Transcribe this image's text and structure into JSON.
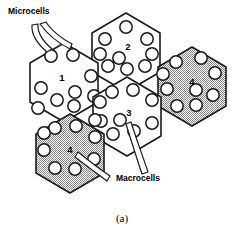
{
  "figure": {
    "caption": "(a)",
    "labels": {
      "microcells": "Microcells",
      "macrocells": "Macrocells"
    },
    "colors": {
      "outline": "#1a1a1a",
      "cell_fill_white": "#ffffff",
      "cell_fill_shaded": "#b8b8b8",
      "text": "#000000"
    },
    "cells": [
      {
        "id": "cell-1",
        "number": "1",
        "type": "microcell-cluster",
        "shaded": false,
        "center_x": 64,
        "center_y": 78,
        "label_x": 62,
        "label_y": 78,
        "microcell_count": 9
      },
      {
        "id": "cell-2",
        "number": "2",
        "type": "microcell-cluster",
        "shaded": false,
        "center_x": 126,
        "center_y": 48,
        "label_x": 128,
        "label_y": 47,
        "microcell_count": 9
      },
      {
        "id": "cell-3",
        "number": "3",
        "type": "microcell-cluster",
        "shaded": false,
        "center_x": 131,
        "center_y": 112,
        "label_x": 129,
        "label_y": 113,
        "microcell_count": 9
      },
      {
        "id": "cell-4-right",
        "number": "4",
        "type": "macrocell",
        "shaded": true,
        "center_x": 192,
        "center_y": 82,
        "label_x": 192,
        "label_y": 82,
        "microcell_count": 9
      },
      {
        "id": "cell-4-bottom-left",
        "number": "4",
        "type": "macrocell",
        "shaded": true,
        "center_x": 70,
        "center_y": 149,
        "label_x": 70,
        "label_y": 150,
        "microcell_count": 9
      }
    ],
    "callouts": [
      {
        "id": "microcells-callout",
        "label": "Microcells",
        "label_x": 8,
        "label_y": 14,
        "points_to": [
          "cell-1"
        ]
      },
      {
        "id": "macrocells-callout",
        "label": "Macrocells",
        "label_x": 116,
        "label_y": 181,
        "points_to": [
          "cell-4-bottom-left",
          "cell-3"
        ]
      }
    ]
  }
}
